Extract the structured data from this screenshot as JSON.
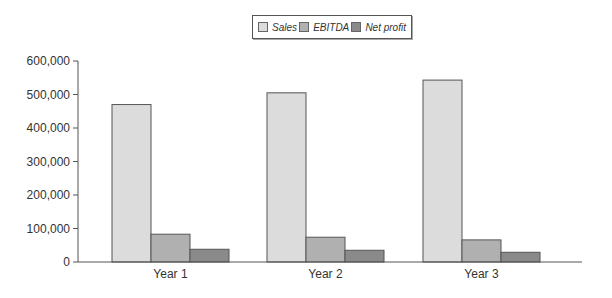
{
  "chart_data": {
    "type": "bar",
    "title": "",
    "xlabel": "",
    "ylabel": "",
    "categories": [
      "Year 1",
      "Year 2",
      "Year 3"
    ],
    "series": [
      {
        "name": "Sales",
        "values": [
          470000,
          505000,
          543000
        ],
        "color": "#dcdcdc"
      },
      {
        "name": "EBITDA",
        "values": [
          83000,
          74000,
          66000
        ],
        "color": "#b0b0b0"
      },
      {
        "name": "Net profit",
        "values": [
          38000,
          35000,
          29000
        ],
        "color": "#8a8a8a"
      }
    ],
    "ylim": [
      0,
      600000
    ],
    "yticks": [
      0,
      100000,
      200000,
      300000,
      400000,
      500000,
      600000
    ],
    "ytick_labels": [
      "0",
      "100,000",
      "200,000",
      "300,000",
      "400,000",
      "500,000",
      "600,000"
    ],
    "grid": false,
    "legend_position": "top-center"
  },
  "legend": {
    "items": [
      {
        "label": "Sales",
        "color": "#dcdcdc"
      },
      {
        "label": "EBITDA",
        "color": "#b0b0b0"
      },
      {
        "label": "Net profit",
        "color": "#8a8a8a"
      }
    ]
  },
  "colors": {
    "axis": "#555555",
    "bar_border": "#555555"
  }
}
